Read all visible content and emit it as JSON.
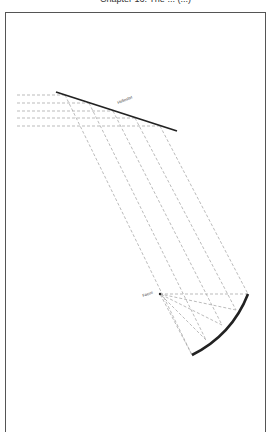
{
  "header": {
    "title": "Chapter 16: The ... (...)"
  },
  "diagram": {
    "flat_mirror_label": "Heliostat",
    "focus_label": "Focus",
    "incoming_rays": 5,
    "colors": {
      "mirror": "#222222",
      "ray": "#aaaaaa",
      "frame": "#555555"
    }
  }
}
